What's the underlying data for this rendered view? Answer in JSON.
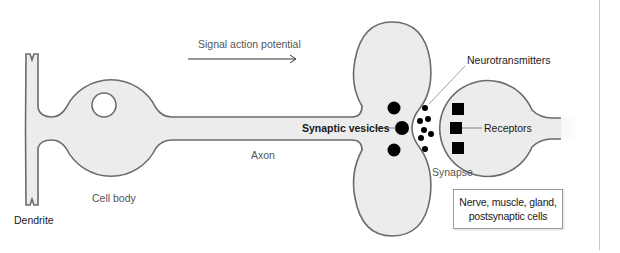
{
  "diagram": {
    "arrow": {
      "label": "Signal action potential",
      "direction": "right"
    },
    "labels": {
      "dendrite": "Dendrite",
      "cell_body": "Cell body",
      "axon": "Axon",
      "synaptic_vesicles": "Synaptic vesicles",
      "neurotransmitters": "Neurotransmitters",
      "synapse": "Synapse",
      "receptors": "Receptors"
    },
    "target_box": {
      "line1": "Nerve, muscle, gland,",
      "line2": "postsynaptic cells"
    },
    "colors": {
      "cell_fill": "#ececec",
      "cell_stroke": "#6b6b6b",
      "particles": "#000000",
      "leader_line": "#888888"
    }
  }
}
